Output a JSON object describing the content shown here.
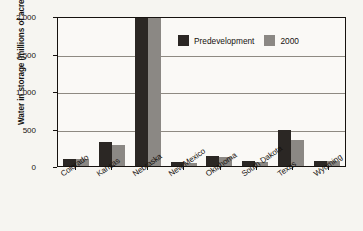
{
  "chart_data": {
    "type": "bar",
    "title": "",
    "xlabel": "",
    "ylabel": "Water in storage (millions of acre-feet)",
    "ylim": [
      0,
      2000
    ],
    "yticks": [
      "0",
      "500",
      "1,000",
      "1,500",
      "2,000"
    ],
    "ytick_values": [
      0,
      500,
      1000,
      1500,
      2000
    ],
    "grid": true,
    "legend_position": "top-right-inside",
    "categories": [
      "Colorado",
      "Kansas",
      "Nebraska",
      "New Mexico",
      "Oklahoma",
      "South Dakota",
      "Texas",
      "Wyoming"
    ],
    "series": [
      {
        "name": "Predevelopment",
        "color": "#2b2724",
        "values": [
          100,
          320,
          2000,
          55,
          135,
          65,
          480,
          70
        ]
      },
      {
        "name": "2000",
        "color": "#8b8884",
        "values": [
          95,
          285,
          2000,
          45,
          120,
          60,
          350,
          65
        ]
      }
    ]
  },
  "legend": {
    "items": [
      {
        "label": "Predevelopment",
        "color": "#2b2724"
      },
      {
        "label": "2000",
        "color": "#8b8884"
      }
    ]
  }
}
